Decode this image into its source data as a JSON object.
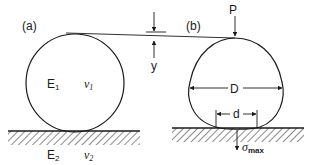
{
  "panel_a": {
    "label": "(a)",
    "sphere_modulus": "E",
    "sphere_modulus_sub": "1",
    "sphere_poisson": "ν",
    "sphere_poisson_sub": "1",
    "plane_modulus": "E",
    "plane_modulus_sub": "2",
    "plane_poisson": "ν",
    "plane_poisson_sub": "2"
  },
  "panel_b": {
    "label": "(b)",
    "load": "P",
    "diameter": "D",
    "contact_diameter": "d",
    "max_stress": "σ",
    "max_stress_sub": "max"
  },
  "deflection": {
    "label": "y"
  },
  "colors": {
    "line": "#1a1a1a",
    "background": "#ffffff"
  }
}
